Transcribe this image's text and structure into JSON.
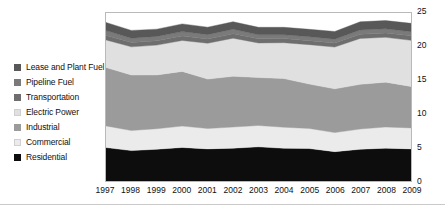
{
  "chart_data": {
    "type": "area",
    "stacked": true,
    "title": "",
    "subtitle": "",
    "xlabel": "",
    "ylabel": "",
    "grid": false,
    "legend_position": "left",
    "categories": [
      "1997",
      "1998",
      "1999",
      "2000",
      "2001",
      "2002",
      "2003",
      "2004",
      "2005",
      "2006",
      "2007",
      "2008",
      "2009"
    ],
    "x": [
      1997,
      1998,
      1999,
      2000,
      2001,
      2002,
      2003,
      2004,
      2005,
      2006,
      2007,
      2008,
      2009
    ],
    "ylim": [
      0,
      25
    ],
    "yticks": [
      0,
      5,
      10,
      15,
      20,
      25
    ],
    "xlim": [
      1997,
      2009
    ],
    "series": [
      {
        "name": "Residential",
        "color": "#0d0d0d",
        "values": [
          4.98,
          4.52,
          4.73,
          4.99,
          4.78,
          4.89,
          5.08,
          4.87,
          4.83,
          4.37,
          4.72,
          4.89,
          4.78
        ]
      },
      {
        "name": "Commercial",
        "color": "#ebebeb",
        "values": [
          3.22,
          2.99,
          3.05,
          3.18,
          3.03,
          3.14,
          3.18,
          3.13,
          2.99,
          2.83,
          3.01,
          3.15,
          3.12
        ]
      },
      {
        "name": "Industrial",
        "color": "#9b9b9b",
        "values": [
          8.7,
          8.26,
          8.0,
          8.14,
          7.35,
          7.55,
          7.15,
          7.24,
          6.6,
          6.51,
          6.65,
          6.67,
          6.17
        ]
      },
      {
        "name": "Electric Power",
        "color": "#e0e0e0",
        "values": [
          4.09,
          4.19,
          4.44,
          4.6,
          5.34,
          5.67,
          5.13,
          5.34,
          5.87,
          6.22,
          6.84,
          6.67,
          6.87
        ]
      },
      {
        "name": "Transportation",
        "color": "#6e6e6e",
        "values": [
          0.65,
          0.64,
          0.65,
          0.66,
          0.64,
          0.67,
          0.62,
          0.62,
          0.59,
          0.6,
          0.63,
          0.64,
          0.66
        ]
      },
      {
        "name": "Pipeline Fuel",
        "color": "#7a7a7a",
        "values": [
          0.75,
          0.64,
          0.65,
          0.66,
          0.64,
          0.67,
          0.59,
          0.57,
          0.58,
          0.58,
          0.62,
          0.63,
          0.62
        ]
      },
      {
        "name": "Lease and Plant Fuel",
        "color": "#585858",
        "values": [
          1.2,
          1.17,
          1.08,
          1.15,
          1.11,
          1.11,
          1.12,
          1.1,
          1.11,
          1.14,
          1.22,
          1.22,
          1.24
        ]
      }
    ]
  },
  "legend": {
    "items": [
      {
        "label": "Lease and Plant Fuel",
        "color": "#585858"
      },
      {
        "label": "Pipeline Fuel",
        "color": "#7a7a7a"
      },
      {
        "label": "Transportation",
        "color": "#6e6e6e"
      },
      {
        "label": "Electric Power",
        "color": "#e0e0e0"
      },
      {
        "label": "Industrial",
        "color": "#9b9b9b"
      },
      {
        "label": "Commercial",
        "color": "#ebebeb"
      },
      {
        "label": "Residential",
        "color": "#0d0d0d"
      }
    ]
  },
  "axes": {
    "y_labels": [
      "25",
      "20",
      "15",
      "10",
      "5",
      "0"
    ],
    "x_labels": [
      "1997",
      "1998",
      "1999",
      "2000",
      "2001",
      "2002",
      "2003",
      "2004",
      "2005",
      "2006",
      "2007",
      "2008",
      "2009"
    ]
  },
  "style": {
    "frame_color": "#b9b9b9",
    "text_color": "#111111",
    "background": "#ffffff"
  }
}
